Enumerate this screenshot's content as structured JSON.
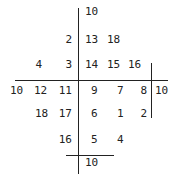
{
  "cells": [
    {
      "v": "10",
      "x": 85,
      "y": 12,
      "align": "left"
    },
    {
      "v": "2",
      "x": 58,
      "y": 40
    },
    {
      "v": "13",
      "x": 85,
      "y": 40,
      "align": "left"
    },
    {
      "v": "18",
      "x": 107,
      "y": 40,
      "align": "left"
    },
    {
      "v": "4",
      "x": 28,
      "y": 65
    },
    {
      "v": "3",
      "x": 58,
      "y": 65
    },
    {
      "v": "14",
      "x": 85,
      "y": 65,
      "align": "left"
    },
    {
      "v": "15",
      "x": 107,
      "y": 65,
      "align": "left"
    },
    {
      "v": "16",
      "x": 128,
      "y": 65,
      "align": "left"
    },
    {
      "v": "10",
      "x": 10,
      "y": 91,
      "align": "left"
    },
    {
      "v": "12",
      "x": 34,
      "y": 91,
      "align": "left"
    },
    {
      "v": "11",
      "x": 58,
      "y": 91
    },
    {
      "v": "9",
      "x": 91,
      "y": 91,
      "align": "left"
    },
    {
      "v": "7",
      "x": 117,
      "y": 91,
      "align": "left"
    },
    {
      "v": "8",
      "x": 133,
      "y": 91
    },
    {
      "v": "10",
      "x": 155,
      "y": 91,
      "align": "left"
    },
    {
      "v": "18",
      "x": 35,
      "y": 114,
      "align": "left"
    },
    {
      "v": "17",
      "x": 58,
      "y": 114
    },
    {
      "v": "6",
      "x": 91,
      "y": 114,
      "align": "left"
    },
    {
      "v": "1",
      "x": 117,
      "y": 114,
      "align": "left"
    },
    {
      "v": "2",
      "x": 133,
      "y": 114
    },
    {
      "v": "16",
      "x": 58,
      "y": 140
    },
    {
      "v": "5",
      "x": 91,
      "y": 140,
      "align": "left"
    },
    {
      "v": "4",
      "x": 117,
      "y": 140,
      "align": "left"
    },
    {
      "v": "10",
      "x": 85,
      "y": 163,
      "align": "left"
    }
  ],
  "lines": [
    {
      "name": "main-vertical",
      "x": 78,
      "y": 8,
      "w": 1,
      "h": 166
    },
    {
      "name": "main-horizontal",
      "x": 15,
      "y": 80,
      "w": 153,
      "h": 1
    },
    {
      "name": "right-vertical",
      "x": 151,
      "y": 63,
      "w": 1,
      "h": 55
    },
    {
      "name": "bottom-horizontal",
      "x": 66,
      "y": 155,
      "w": 48,
      "h": 1
    }
  ]
}
